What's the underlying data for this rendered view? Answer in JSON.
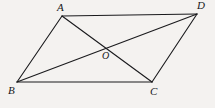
{
  "figure": {
    "caption": "Parallelogram ABCD with diagonals AC and BD meeting at O",
    "background_color": "#f4f2f0",
    "stroke_color": "#1a1a1d",
    "label_color": "#17171a",
    "stroke_width": 1.1,
    "vertices": [
      {
        "name": "A",
        "label": "A",
        "x": 62,
        "y": 16
      },
      {
        "name": "D",
        "label": "D",
        "x": 197,
        "y": 14
      },
      {
        "name": "B",
        "label": "B",
        "x": 17,
        "y": 82
      },
      {
        "name": "C",
        "label": "C",
        "x": 152,
        "y": 82
      },
      {
        "name": "O",
        "label": "O",
        "x": 104,
        "y": 50
      }
    ],
    "edges": [
      {
        "name": "side-AD",
        "from": "A",
        "to": "D",
        "x1": 62,
        "y1": 16,
        "x2": 197,
        "y2": 14
      },
      {
        "name": "side-AB",
        "from": "A",
        "to": "B",
        "x1": 62,
        "y1": 16,
        "x2": 17,
        "y2": 82
      },
      {
        "name": "side-BC",
        "from": "B",
        "to": "C",
        "x1": 17,
        "y1": 82,
        "x2": 152,
        "y2": 82
      },
      {
        "name": "side-DC",
        "from": "D",
        "to": "C",
        "x1": 197,
        "y1": 14,
        "x2": 152,
        "y2": 82
      },
      {
        "name": "diagonal-AC",
        "from": "A",
        "to": "C",
        "x1": 62,
        "y1": 16,
        "x2": 152,
        "y2": 82
      },
      {
        "name": "diagonal-BD",
        "from": "B",
        "to": "D",
        "x1": 17,
        "y1": 82,
        "x2": 197,
        "y2": 14
      }
    ],
    "labels": {
      "A": "A",
      "B": "B",
      "C": "C",
      "D": "D",
      "O": "O"
    }
  }
}
